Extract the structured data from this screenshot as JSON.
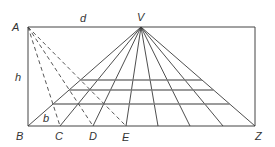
{
  "diagram": {
    "colors": {
      "line": "#3a3a3a",
      "frame": "#444444",
      "grid_horizontal": "#7a7a7a",
      "label": "#333333",
      "background": "#ffffff"
    },
    "labels": {
      "A": "A",
      "V": "V",
      "B": "B",
      "C": "C",
      "D": "D",
      "E": "E",
      "Z": "Z",
      "d": "d",
      "h": "h",
      "b": "b"
    },
    "points": {
      "A": [
        28,
        27
      ],
      "V": [
        141,
        27
      ],
      "top_right": [
        255,
        27
      ],
      "B": [
        28,
        126
      ],
      "Z": [
        255,
        126
      ]
    },
    "baseline_points_x": [
      28,
      60,
      93,
      126,
      158,
      190,
      223,
      255
    ],
    "dashed_targets": [
      "C",
      "D",
      "E"
    ],
    "horizontal_lines_y": [
      80,
      90,
      104
    ]
  }
}
